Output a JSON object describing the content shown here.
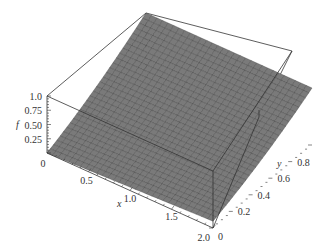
{
  "chart_data": {
    "type": "surface3d",
    "title": "",
    "xlabel": "x",
    "ylabel": "y",
    "zlabel": "f",
    "xlim": [
      0,
      2.0
    ],
    "ylim": [
      0,
      1.0
    ],
    "zlim": [
      0,
      1.0
    ],
    "x_ticks": [
      "0",
      "0.5",
      "1.0",
      "1.5",
      "2.0"
    ],
    "y_ticks": [
      "0",
      "0.2",
      "0.4",
      "0.6",
      "0.8",
      "1.0"
    ],
    "z_ticks": [
      "0.25",
      "0.50",
      "0.75",
      "1.0"
    ],
    "surface_color": "#7a7a7a",
    "mesh_color": "#3a3a3a",
    "box": true,
    "grid_resolution": 30,
    "corner_values": [
      {
        "x": 0,
        "y": 0,
        "f": 0.0
      },
      {
        "x": 2.0,
        "y": 0,
        "f": 0.1
      },
      {
        "x": 0,
        "y": 1.0,
        "f": 1.0
      },
      {
        "x": 2.0,
        "y": 1.0,
        "f": 1.0
      }
    ]
  }
}
